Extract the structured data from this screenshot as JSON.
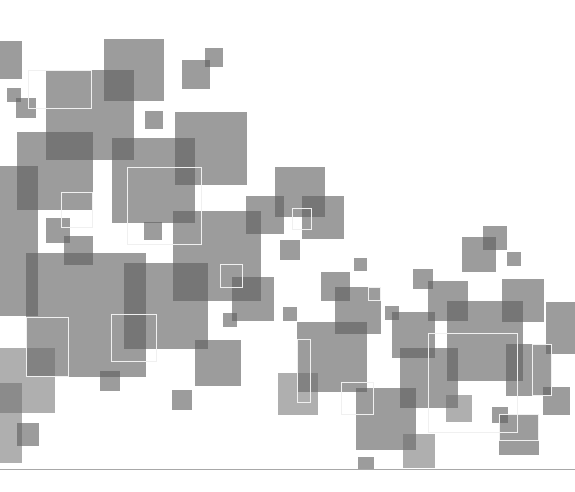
{
  "artwork": {
    "description": "Abstract composition of overlapping translucent gray squares",
    "background": "#ffffff",
    "square_color": "#606060",
    "outline_color": "#f0f0f0",
    "baseline": {
      "x": 0,
      "y": 469,
      "width": 575,
      "color": "#a8a8a8"
    },
    "squares": [
      {
        "x": 0,
        "y": 41,
        "w": 22,
        "h": 38,
        "t": "fill"
      },
      {
        "x": 104,
        "y": 39,
        "w": 60,
        "h": 62,
        "t": "fill"
      },
      {
        "x": 46,
        "y": 70,
        "w": 88,
        "h": 90,
        "t": "fill"
      },
      {
        "x": 182,
        "y": 60,
        "w": 28,
        "h": 29,
        "t": "fill"
      },
      {
        "x": 205,
        "y": 48,
        "w": 18,
        "h": 19,
        "t": "fill"
      },
      {
        "x": 7,
        "y": 88,
        "w": 14,
        "h": 14,
        "t": "fill"
      },
      {
        "x": 16,
        "y": 98,
        "w": 20,
        "h": 20,
        "t": "fill"
      },
      {
        "x": 145,
        "y": 111,
        "w": 18,
        "h": 18,
        "t": "fill"
      },
      {
        "x": 175,
        "y": 112,
        "w": 72,
        "h": 73,
        "t": "fill"
      },
      {
        "x": 17,
        "y": 132,
        "w": 76,
        "h": 78,
        "t": "fill"
      },
      {
        "x": 112,
        "y": 138,
        "w": 83,
        "h": 85,
        "t": "fill"
      },
      {
        "x": 0,
        "y": 166,
        "w": 38,
        "h": 150,
        "t": "fill"
      },
      {
        "x": 275,
        "y": 167,
        "w": 50,
        "h": 50,
        "t": "fill"
      },
      {
        "x": 246,
        "y": 196,
        "w": 38,
        "h": 38,
        "t": "fill"
      },
      {
        "x": 302,
        "y": 196,
        "w": 42,
        "h": 43,
        "t": "fill"
      },
      {
        "x": 280,
        "y": 240,
        "w": 20,
        "h": 20,
        "t": "fill"
      },
      {
        "x": 46,
        "y": 218,
        "w": 24,
        "h": 25,
        "t": "fill"
      },
      {
        "x": 64,
        "y": 236,
        "w": 29,
        "h": 29,
        "t": "fill"
      },
      {
        "x": 173,
        "y": 211,
        "w": 88,
        "h": 90,
        "t": "fill"
      },
      {
        "x": 144,
        "y": 222,
        "w": 18,
        "h": 18,
        "t": "fill"
      },
      {
        "x": 26,
        "y": 253,
        "w": 120,
        "h": 124,
        "t": "fill"
      },
      {
        "x": 124,
        "y": 263,
        "w": 84,
        "h": 86,
        "t": "fill"
      },
      {
        "x": 232,
        "y": 277,
        "w": 42,
        "h": 44,
        "t": "fill"
      },
      {
        "x": 223,
        "y": 313,
        "w": 14,
        "h": 14,
        "t": "fill"
      },
      {
        "x": 195,
        "y": 340,
        "w": 46,
        "h": 46,
        "t": "fill"
      },
      {
        "x": 100,
        "y": 371,
        "w": 20,
        "h": 20,
        "t": "fill"
      },
      {
        "x": 0,
        "y": 348,
        "w": 55,
        "h": 65,
        "t": "fill light"
      },
      {
        "x": 0,
        "y": 383,
        "w": 22,
        "h": 80,
        "t": "fill light"
      },
      {
        "x": 17,
        "y": 423,
        "w": 22,
        "h": 23,
        "t": "fill"
      },
      {
        "x": 172,
        "y": 390,
        "w": 20,
        "h": 20,
        "t": "fill"
      },
      {
        "x": 462,
        "y": 237,
        "w": 34,
        "h": 35,
        "t": "fill"
      },
      {
        "x": 483,
        "y": 226,
        "w": 24,
        "h": 24,
        "t": "fill"
      },
      {
        "x": 507,
        "y": 252,
        "w": 14,
        "h": 14,
        "t": "fill"
      },
      {
        "x": 354,
        "y": 258,
        "w": 13,
        "h": 13,
        "t": "fill"
      },
      {
        "x": 413,
        "y": 269,
        "w": 20,
        "h": 20,
        "t": "fill"
      },
      {
        "x": 321,
        "y": 272,
        "w": 29,
        "h": 29,
        "t": "fill"
      },
      {
        "x": 335,
        "y": 287,
        "w": 46,
        "h": 47,
        "t": "fill"
      },
      {
        "x": 428,
        "y": 281,
        "w": 40,
        "h": 40,
        "t": "fill"
      },
      {
        "x": 447,
        "y": 301,
        "w": 76,
        "h": 80,
        "t": "fill"
      },
      {
        "x": 502,
        "y": 279,
        "w": 42,
        "h": 43,
        "t": "fill"
      },
      {
        "x": 546,
        "y": 302,
        "w": 29,
        "h": 52,
        "t": "fill"
      },
      {
        "x": 283,
        "y": 307,
        "w": 14,
        "h": 14,
        "t": "fill"
      },
      {
        "x": 297,
        "y": 322,
        "w": 70,
        "h": 70,
        "t": "fill"
      },
      {
        "x": 385,
        "y": 306,
        "w": 14,
        "h": 14,
        "t": "fill"
      },
      {
        "x": 392,
        "y": 312,
        "w": 43,
        "h": 46,
        "t": "fill"
      },
      {
        "x": 400,
        "y": 348,
        "w": 58,
        "h": 60,
        "t": "fill"
      },
      {
        "x": 506,
        "y": 344,
        "w": 45,
        "h": 52,
        "t": "fill"
      },
      {
        "x": 543,
        "y": 387,
        "w": 27,
        "h": 28,
        "t": "fill"
      },
      {
        "x": 278,
        "y": 373,
        "w": 40,
        "h": 42,
        "t": "fill light"
      },
      {
        "x": 356,
        "y": 388,
        "w": 60,
        "h": 62,
        "t": "fill"
      },
      {
        "x": 446,
        "y": 395,
        "w": 26,
        "h": 27,
        "t": "fill light"
      },
      {
        "x": 492,
        "y": 407,
        "w": 16,
        "h": 16,
        "t": "fill"
      },
      {
        "x": 499,
        "y": 414,
        "w": 40,
        "h": 41,
        "t": "fill"
      },
      {
        "x": 403,
        "y": 434,
        "w": 32,
        "h": 34,
        "t": "fill light"
      },
      {
        "x": 358,
        "y": 457,
        "w": 16,
        "h": 12,
        "t": "fill"
      }
    ],
    "outlines": [
      {
        "x": 28,
        "y": 70,
        "w": 64,
        "h": 39
      },
      {
        "x": 127,
        "y": 167,
        "w": 75,
        "h": 78
      },
      {
        "x": 61,
        "y": 192,
        "w": 32,
        "h": 36
      },
      {
        "x": 292,
        "y": 208,
        "w": 20,
        "h": 22
      },
      {
        "x": 220,
        "y": 264,
        "w": 23,
        "h": 24
      },
      {
        "x": 26,
        "y": 317,
        "w": 43,
        "h": 60
      },
      {
        "x": 111,
        "y": 314,
        "w": 46,
        "h": 48
      },
      {
        "x": 297,
        "y": 339,
        "w": 14,
        "h": 64
      },
      {
        "x": 341,
        "y": 382,
        "w": 33,
        "h": 33
      },
      {
        "x": 428,
        "y": 333,
        "w": 90,
        "h": 100
      },
      {
        "x": 532,
        "y": 344,
        "w": 20,
        "h": 52
      },
      {
        "x": 499,
        "y": 414,
        "w": 40,
        "h": 27
      },
      {
        "x": 368,
        "y": 287,
        "w": 13,
        "h": 14
      }
    ]
  }
}
